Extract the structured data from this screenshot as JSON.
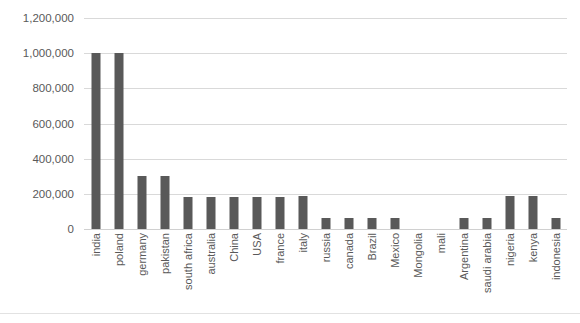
{
  "chart_data": {
    "type": "bar",
    "title": "",
    "xlabel": "",
    "ylabel": "",
    "ylim": [
      0,
      1200000
    ],
    "ytick_step": 200000,
    "grid": true,
    "legend": null,
    "bar_color": "#595959",
    "gridline_color": "#d9d9d9",
    "text_color": "#595959",
    "background": "#ffffff",
    "ytick_labels": [
      "1,200,000",
      "1,000,000",
      "800,000",
      "600,000",
      "400,000",
      "200,000",
      "0"
    ],
    "ytick_values": [
      1200000,
      1000000,
      800000,
      600000,
      400000,
      200000,
      0
    ],
    "categories": [
      "india",
      "poland",
      "germany",
      "pakistan",
      "south africa",
      "australia",
      "China",
      "USA",
      "france",
      "italy",
      "russia",
      "canada",
      "Brazil",
      "Mexico",
      "Mongolia",
      "mali",
      "Argentina",
      "saudi arabia",
      "nigeria",
      "kenya",
      "indonesia"
    ],
    "values": [
      1000000,
      1000000,
      300000,
      300000,
      180000,
      180000,
      180000,
      180000,
      180000,
      185000,
      60000,
      60000,
      60000,
      60000,
      0,
      0,
      60000,
      60000,
      185000,
      185000,
      60000
    ]
  }
}
